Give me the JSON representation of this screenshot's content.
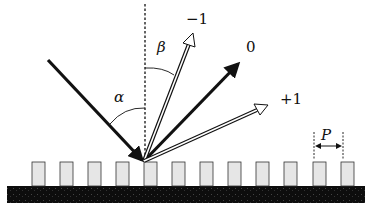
{
  "diagram": {
    "labels": {
      "order_minus1": "−1",
      "order_zero": "0",
      "order_plus1": "+1",
      "angle_alpha": "α",
      "angle_beta": "β",
      "period": "P"
    },
    "colors": {
      "ink": "#111111",
      "ridge_fill": "#e6e6e6",
      "substrate": "#0d0d0d",
      "background": "#ffffff"
    },
    "grating": {
      "ridge_x": [
        32,
        60,
        88,
        116,
        144,
        172,
        200,
        228,
        256,
        284,
        313,
        341
      ],
      "ridge_width": 13,
      "ridge_top": 162,
      "ridge_bottom": 186,
      "substrate": {
        "x": 7,
        "y": 186,
        "width": 358,
        "height": 17
      }
    },
    "rays": {
      "incident": {
        "from": [
          48,
          60
        ],
        "to": [
          144,
          162
        ],
        "style": "solid-thick"
      },
      "order_zero": {
        "from": [
          144,
          162
        ],
        "to": [
          240,
          62
        ],
        "style": "solid-thick"
      },
      "order_minus1": {
        "from": [
          144,
          162
        ],
        "to": [
          193,
          33
        ],
        "style": "hollow"
      },
      "order_plus1": {
        "from": [
          144,
          162
        ],
        "to": [
          268,
          105
        ],
        "style": "hollow"
      }
    },
    "normal_line": {
      "x": 145,
      "y1": 4,
      "y2": 160
    }
  }
}
